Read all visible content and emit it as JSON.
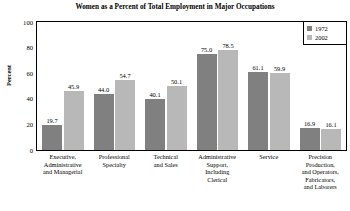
{
  "chart_data": {
    "type": "bar",
    "title": "Women as a Percent of Total Employment in Major Occupations",
    "xlabel": "",
    "ylabel": "Percent",
    "ylim": [
      0,
      100
    ],
    "yticks": [
      0,
      20,
      40,
      60,
      80,
      100
    ],
    "grid": false,
    "legend_position": "top-right",
    "categories": [
      "Executive, Administrative and Managerial",
      "Professional Specialty",
      "Technical and Sales",
      "Administrative Support, Including Clerical",
      "Service",
      "Precision Production, and Operators, Fabricators, and Laborers"
    ],
    "category_lines": [
      [
        "Executive,",
        "Administrative",
        "and Managerial"
      ],
      [
        "Professional",
        "Specialty"
      ],
      [
        "Technical",
        "and Sales"
      ],
      [
        "Administrative",
        "Support,",
        "Including",
        "Clerical"
      ],
      [
        "Service"
      ],
      [
        "Precision",
        "Production,",
        "and Operators,",
        "Fabricators,",
        "and Laborers"
      ]
    ],
    "series": [
      {
        "name": "1972",
        "color": "#808080",
        "values": [
          19.7,
          44.0,
          40.1,
          75.0,
          61.1,
          16.9
        ],
        "labels": [
          "19.7",
          "44.0",
          "40.1",
          "75.0",
          "61.1",
          "16.9"
        ]
      },
      {
        "name": "2002",
        "color": "#b8b8b8",
        "values": [
          45.9,
          54.7,
          50.1,
          78.5,
          59.9,
          16.1
        ],
        "labels": [
          "45.9",
          "54.7",
          "50.1",
          "78.5",
          "59.9",
          "16.1"
        ]
      }
    ]
  },
  "colors": {
    "series_1972": "#808080",
    "series_2002": "#b8b8b8",
    "axis": "#000000",
    "background": "#ffffff"
  }
}
